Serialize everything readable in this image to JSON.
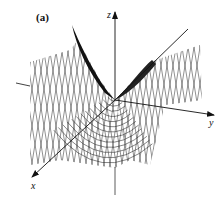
{
  "figure": {
    "panel_label": "(a)",
    "axes": {
      "x_label": "x",
      "y_label": "y",
      "z_label": "z"
    },
    "colors": {
      "line": "#111111",
      "background": "#ffffff"
    }
  }
}
